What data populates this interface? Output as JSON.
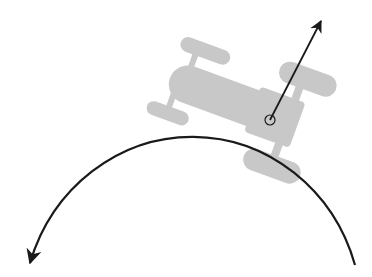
{
  "diagram": {
    "colors": {
      "background": "#ffffff",
      "car": "#c8c8c8",
      "path": "#1a1a1a",
      "vector": "#1a1a1a"
    },
    "path": {
      "type": "circular-arc",
      "start": [
        30,
        263
      ],
      "apex": [
        190,
        100
      ],
      "end": [
        355,
        265
      ],
      "direction": "counterclockwise",
      "arrowhead_at": "start"
    },
    "velocity_vector": {
      "origin": [
        270,
        120
      ],
      "tip": [
        322,
        20
      ]
    },
    "marker": {
      "shape": "circle",
      "center": [
        270,
        120
      ],
      "radius": 5
    },
    "car": {
      "rotation_deg": 20,
      "orientation": "front toward upper-left"
    }
  }
}
